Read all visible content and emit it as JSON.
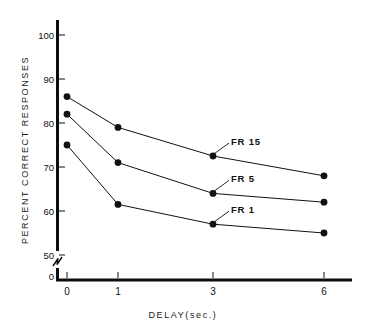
{
  "chart_data": {
    "type": "line",
    "title": "",
    "xlabel": "DELAY(sec.)",
    "ylabel": "PERCENT  CORRECT  RESPONSES",
    "categories": [
      "0",
      "1",
      "3",
      "6"
    ],
    "x_tick_labels": [
      "0",
      "1",
      "3",
      "6"
    ],
    "y_tick_labels": [
      "0",
      "50",
      "60",
      "70",
      "80",
      "90",
      "100"
    ],
    "y_tick_values": [
      0,
      50,
      60,
      70,
      80,
      90,
      100
    ],
    "ylim": [
      50,
      103
    ],
    "axis_break": true,
    "axis_break_label": "0",
    "grid": false,
    "legend_position": "inline-annotations",
    "series": [
      {
        "name": "FR 15",
        "label": "FR 15",
        "values": [
          86,
          79,
          72.5,
          68
        ],
        "color": "#111111"
      },
      {
        "name": "FR 5",
        "label": "FR 5",
        "values": [
          82,
          71,
          64,
          62
        ],
        "color": "#111111"
      },
      {
        "name": "FR 1",
        "label": "FR 1",
        "values": [
          75,
          61.5,
          57,
          55
        ],
        "color": "#111111"
      }
    ],
    "annotations": [
      {
        "text": "FR 15",
        "target_series": "FR 15",
        "target_category": "3"
      },
      {
        "text": "FR 5",
        "target_series": "FR 5",
        "target_category": "3"
      },
      {
        "text": "FR 1",
        "target_series": "FR 1",
        "target_category": "3"
      }
    ]
  },
  "figure": {
    "background_color": "#ffffff",
    "ink_color": "#111111"
  }
}
